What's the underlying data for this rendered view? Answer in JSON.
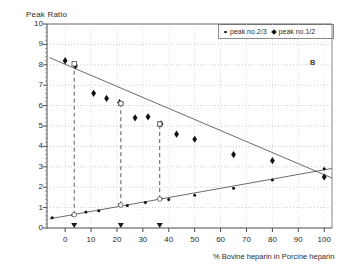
{
  "chart_data": {
    "type": "scatter",
    "title": "",
    "panel_label": "B",
    "ylabel": "Peak Ratio",
    "xlabel": "% Bovine heparin in Porcine heparin",
    "xlim": [
      -7,
      103
    ],
    "ylim": [
      0,
      10
    ],
    "xticks": [
      0,
      10,
      20,
      30,
      40,
      50,
      60,
      70,
      80,
      90,
      100
    ],
    "yticks": [
      0,
      1,
      2,
      3,
      4,
      5,
      6,
      7,
      8,
      9,
      10
    ],
    "grid": "dotted-horizontal-and-vertical",
    "legend_position": "top-right",
    "series": [
      {
        "name": "peak no.1/2",
        "marker": "filled-diamond",
        "trend": "decreasing",
        "points": [
          {
            "x": 0,
            "y": 8.2
          },
          {
            "x": 4,
            "y": 7.95
          },
          {
            "x": 11,
            "y": 6.6
          },
          {
            "x": 16,
            "y": 6.35
          },
          {
            "x": 21,
            "y": 6.15
          },
          {
            "x": 27,
            "y": 5.4
          },
          {
            "x": 32,
            "y": 5.45
          },
          {
            "x": 37,
            "y": 5.1
          },
          {
            "x": 43,
            "y": 4.6
          },
          {
            "x": 50,
            "y": 4.35
          },
          {
            "x": 65,
            "y": 3.6
          },
          {
            "x": 80,
            "y": 3.3
          },
          {
            "x": 100,
            "y": 2.5
          }
        ],
        "fit_line": [
          {
            "x": -6,
            "y": 8.35
          },
          {
            "x": 103,
            "y": 2.45
          }
        ]
      },
      {
        "name": "peak no.2/3",
        "marker": "small-dot",
        "trend": "increasing",
        "points": [
          {
            "x": -5,
            "y": 0.5
          },
          {
            "x": 3,
            "y": 0.62
          },
          {
            "x": 8,
            "y": 0.78
          },
          {
            "x": 13,
            "y": 0.85
          },
          {
            "x": 21,
            "y": 1.15
          },
          {
            "x": 24,
            "y": 1.1
          },
          {
            "x": 31,
            "y": 1.25
          },
          {
            "x": 37,
            "y": 1.45
          },
          {
            "x": 40,
            "y": 1.4
          },
          {
            "x": 50,
            "y": 1.6
          },
          {
            "x": 65,
            "y": 1.95
          },
          {
            "x": 80,
            "y": 2.35
          },
          {
            "x": 100,
            "y": 2.9
          }
        ],
        "fit_line": [
          {
            "x": -6,
            "y": 0.45
          },
          {
            "x": 103,
            "y": 2.92
          }
        ]
      }
    ],
    "reference_lines": [
      {
        "x": 3.5,
        "upper_y": 8.05,
        "lower_y": 0.65
      },
      {
        "x": 21.5,
        "upper_y": 6.1,
        "lower_y": 1.12
      },
      {
        "x": 36.5,
        "upper_y": 5.1,
        "lower_y": 1.42
      }
    ],
    "reference_markers": "open-square-and-open-circle-at-intersections",
    "axis_triangles": [
      3.5,
      21.5,
      36.5
    ]
  }
}
